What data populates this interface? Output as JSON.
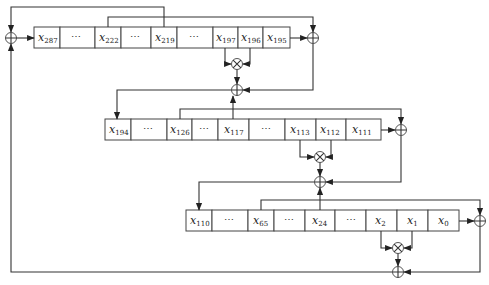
{
  "diagram": {
    "type": "Trivium keystream generator (three shift registers)",
    "registers": [
      {
        "name": "register-A",
        "cells": [
          {
            "var": "x",
            "sub": "287"
          },
          {
            "var": "⋯",
            "sub": ""
          },
          {
            "var": "x",
            "sub": "222"
          },
          {
            "var": "⋯",
            "sub": ""
          },
          {
            "var": "x",
            "sub": "219"
          },
          {
            "var": "⋯",
            "sub": ""
          },
          {
            "var": "x",
            "sub": "197"
          },
          {
            "var": "x",
            "sub": "196"
          },
          {
            "var": "x",
            "sub": "195"
          }
        ]
      },
      {
        "name": "register-B",
        "cells": [
          {
            "var": "x",
            "sub": "194"
          },
          {
            "var": "⋯",
            "sub": ""
          },
          {
            "var": "x",
            "sub": "126"
          },
          {
            "var": "⋯",
            "sub": ""
          },
          {
            "var": "x",
            "sub": "117"
          },
          {
            "var": "⋯",
            "sub": ""
          },
          {
            "var": "x",
            "sub": "113"
          },
          {
            "var": "x",
            "sub": "112"
          },
          {
            "var": "x",
            "sub": "111"
          }
        ]
      },
      {
        "name": "register-C",
        "cells": [
          {
            "var": "x",
            "sub": "110"
          },
          {
            "var": "⋯",
            "sub": ""
          },
          {
            "var": "x",
            "sub": "65"
          },
          {
            "var": "⋯",
            "sub": ""
          },
          {
            "var": "x",
            "sub": "24"
          },
          {
            "var": "⋯",
            "sub": ""
          },
          {
            "var": "x",
            "sub": "2"
          },
          {
            "var": "x",
            "sub": "1"
          },
          {
            "var": "x",
            "sub": "0"
          }
        ]
      }
    ],
    "symbols": {
      "xor": "⊕",
      "and": "⊗"
    }
  }
}
